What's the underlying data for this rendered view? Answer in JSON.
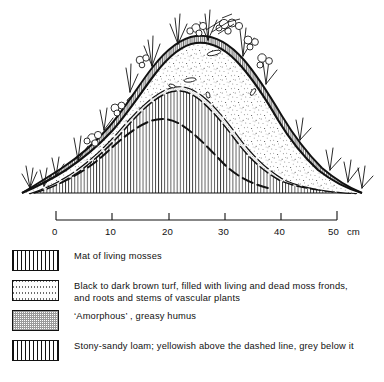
{
  "figure": {
    "layers": [
      {
        "id": "moss-mat",
        "name": "Mat of living mosses"
      },
      {
        "id": "turf",
        "name": "Black to dark brown turf"
      },
      {
        "id": "amorphous-humus",
        "name": "'Amorphous', greasy humus"
      },
      {
        "id": "stony-sandy-loam",
        "name": "Stony-sandy loam"
      }
    ],
    "annotations": {
      "dashed_line_note": "dashed line inside loam separates yellowish above from grey below"
    }
  },
  "scale": {
    "unit": "cm",
    "unit_label": "cm",
    "ticks": [
      "0",
      "10",
      "20",
      "30",
      "40",
      "50"
    ],
    "min": 0,
    "max": 50
  },
  "legend": {
    "items": [
      {
        "swatch": "moss-hatch",
        "line1": "Mat of living mosses",
        "line2": ""
      },
      {
        "swatch": "turf-stipple",
        "line1": "Black to dark brown turf, filled with living and dead moss fronds,",
        "line2": "and roots and stems of vascular plants"
      },
      {
        "swatch": "humus-crosshatch",
        "line1": "‘Amorphous’ , greasy humus",
        "line2": ""
      },
      {
        "swatch": "loam-vertical",
        "line1": "Stony-sandy loam; yellowish above the dashed line, grey below it",
        "line2": ""
      }
    ]
  },
  "colors": {
    "ink": "#111111",
    "background": "#ffffff",
    "hatch_grey": "#9a9a9a"
  }
}
